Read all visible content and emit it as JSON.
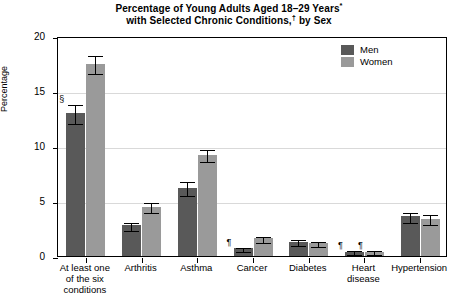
{
  "chart_data": {
    "type": "bar",
    "title": "Percentage of Young Adults Aged 18–29 Years* with Selected Chronic Conditions,† by Sex",
    "title_line1": "Percentage of Young Adults Aged 18–29 Years",
    "title_line1_sup": "*",
    "title_line2": "with Selected Chronic Conditions,",
    "title_line2_sup": "†",
    "title_line2_tail": " by Sex",
    "xlabel": "",
    "ylabel": "Percentage",
    "ylim": [
      0,
      20
    ],
    "yticks": [
      0,
      5,
      10,
      15,
      20
    ],
    "ytick_labels": [
      "0",
      "5",
      "10",
      "15",
      "20"
    ],
    "grid": true,
    "legend_position": "top-right",
    "categories": [
      "At least one\nof the six\nconditions",
      "Arthritis",
      "Asthma",
      "Cancer",
      "Diabetes",
      "Heart\ndisease",
      "Hypertension"
    ],
    "series": [
      {
        "name": "Men",
        "color": "#595959",
        "values": [
          13.0,
          2.8,
          6.2,
          0.7,
          1.3,
          0.4,
          3.6
        ],
        "err_low": [
          0.9,
          0.4,
          0.7,
          0.25,
          0.3,
          0.2,
          0.5
        ],
        "err_high": [
          0.9,
          0.4,
          0.7,
          0.25,
          0.3,
          0.2,
          0.5
        ],
        "markers": [
          "§",
          "",
          "",
          "¶",
          "",
          "¶",
          ""
        ]
      },
      {
        "name": "Women",
        "color": "#9a9a9a",
        "values": [
          17.5,
          4.5,
          9.2,
          1.6,
          1.2,
          0.4,
          3.4
        ],
        "err_low": [
          0.9,
          0.5,
          0.6,
          0.35,
          0.3,
          0.2,
          0.5
        ],
        "err_high": [
          0.9,
          0.5,
          0.6,
          0.35,
          0.3,
          0.2,
          0.5
        ],
        "markers": [
          "",
          "",
          "",
          "",
          "",
          "¶",
          ""
        ]
      }
    ]
  },
  "legend": {
    "items": [
      {
        "label": "Men",
        "color": "#595959"
      },
      {
        "label": "Women",
        "color": "#9a9a9a"
      }
    ]
  }
}
